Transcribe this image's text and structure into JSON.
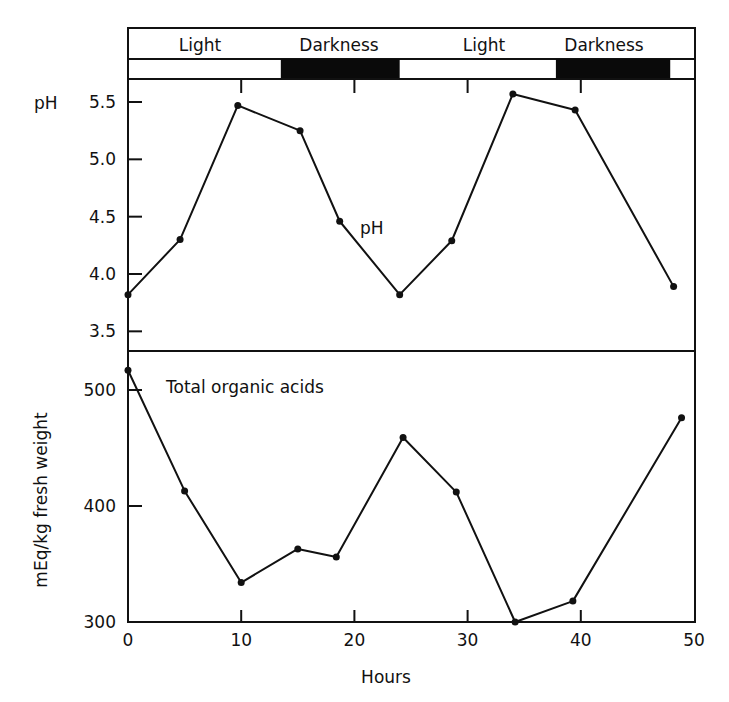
{
  "chart_data": [
    {
      "type": "line",
      "panel": "top",
      "title": "",
      "series_label": "pH",
      "xlabel": "Hours",
      "ylabel": "pH",
      "xlim": [
        0,
        50
      ],
      "ylim": [
        3.3,
        5.75
      ],
      "yticks": [
        "5.5",
        "5.0",
        "4.5",
        "4.0",
        "3.5"
      ],
      "ytick_values": [
        5.5,
        5.0,
        4.5,
        4.0,
        3.5
      ],
      "x": [
        0,
        4.6,
        9.7,
        15.2,
        18.7,
        24.0,
        28.6,
        34.0,
        39.5,
        48.2
      ],
      "values": [
        3.82,
        4.3,
        5.47,
        5.25,
        4.46,
        3.82,
        4.29,
        5.57,
        5.43,
        3.89
      ],
      "grid": false
    },
    {
      "type": "line",
      "panel": "bottom",
      "title": "",
      "series_label": "Total organic acids",
      "xlabel": "Hours",
      "ylabel": "mEq/kg fresh weight",
      "xlim": [
        0,
        50
      ],
      "ylim": [
        300,
        530
      ],
      "yticks": [
        "500",
        "400",
        "300"
      ],
      "ytick_values": [
        500,
        400,
        300
      ],
      "xticks": [
        "0",
        "10",
        "20",
        "30",
        "40",
        "50"
      ],
      "xtick_values": [
        0,
        10,
        20,
        30,
        40,
        50
      ],
      "x": [
        0,
        5.0,
        10.0,
        15.0,
        18.4,
        24.3,
        29.0,
        34.2,
        39.3,
        48.9
      ],
      "values": [
        517,
        413,
        334,
        363,
        356,
        459,
        412,
        300,
        318,
        476
      ],
      "grid": false
    }
  ],
  "photoperiod": {
    "labels": [
      "Light",
      "Darkness",
      "Light",
      "Darkness"
    ],
    "dark_intervals_hours": [
      [
        13.5,
        24.0
      ],
      [
        37.8,
        47.9
      ]
    ],
    "dark_color": "#0a0a0a",
    "light_color": "#ffffff"
  },
  "labels": {
    "ph_axis_title": "pH",
    "ph_series_label": "pH",
    "acids_axis_title": "mEq/kg fresh weight",
    "acids_series_label": "Total organic acids",
    "x_axis_title": "Hours"
  }
}
